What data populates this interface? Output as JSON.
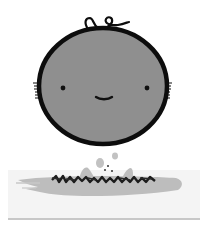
{
  "illustration": {
    "subject": "round-faced character",
    "head": {
      "fill": "#8f8f8f",
      "outline": "#0d0d0d",
      "hair_curl": "single looped curl on top"
    },
    "face": {
      "eyes": 2,
      "mouth": "small smile"
    },
    "splash": {
      "color": "#bdbdbd",
      "card_color": "#f3f3f3",
      "scribble_text": "illegible scribble"
    }
  },
  "colors": {
    "background": "#ffffff",
    "head_fill": "#8f8f8f",
    "outline": "#0d0d0d",
    "splash": "#bdbdbd",
    "card": "#f3f3f3",
    "card_edge": "#9a9a9a"
  }
}
